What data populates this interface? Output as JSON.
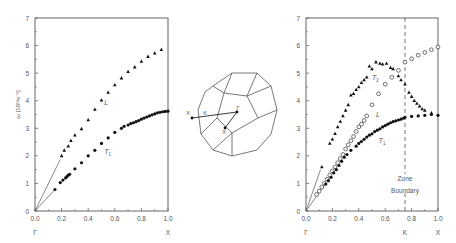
{
  "figure": {
    "colors": {
      "axis": "#666666",
      "marker": "#111111",
      "line": "#555555",
      "text": "#555555"
    }
  },
  "chart_data": [
    {
      "type": "scatter",
      "title": "",
      "xlabel": "",
      "ylabel": "ω [10¹³s⁻¹]",
      "xlim": [
        0,
        1.0
      ],
      "ylim": [
        0,
        7
      ],
      "xticks": [
        "0.0",
        "0.2",
        "0.4",
        "0.6",
        "0.8",
        "1.0"
      ],
      "yticks": [
        "0",
        "1",
        "2",
        "3",
        "4",
        "5",
        "6",
        "7"
      ],
      "point_labels": [
        {
          "text": "Γ",
          "x": 0.0
        },
        {
          "text": "X",
          "x": 1.0
        }
      ],
      "grid": false,
      "series": [
        {
          "name": "L",
          "marker": "triangle",
          "x": [
            0.2,
            0.22,
            0.25,
            0.27,
            0.3,
            0.35,
            0.4,
            0.45,
            0.5,
            0.55,
            0.6,
            0.65,
            0.7,
            0.75,
            0.8,
            0.85,
            0.9,
            0.95
          ],
          "y": [
            2.0,
            2.2,
            2.35,
            2.55,
            2.75,
            2.98,
            3.3,
            3.68,
            4.02,
            4.3,
            4.57,
            4.82,
            5.05,
            5.22,
            5.42,
            5.6,
            5.72,
            5.85
          ]
        },
        {
          "name": "T₁",
          "marker": "circle",
          "x": [
            0.15,
            0.19,
            0.21,
            0.23,
            0.24,
            0.25,
            0.26,
            0.3,
            0.35,
            0.4,
            0.45,
            0.5,
            0.55,
            0.6,
            0.65,
            0.67,
            0.7,
            0.72,
            0.74,
            0.76,
            0.78,
            0.8,
            0.82,
            0.84,
            0.86,
            0.88,
            0.9,
            0.92,
            0.94,
            0.96,
            0.98,
            1.0
          ],
          "y": [
            0.78,
            1.03,
            1.12,
            1.2,
            1.25,
            1.3,
            1.33,
            1.53,
            1.75,
            2.0,
            2.2,
            2.45,
            2.65,
            2.85,
            3.0,
            3.07,
            3.12,
            3.17,
            3.2,
            3.24,
            3.28,
            3.33,
            3.37,
            3.41,
            3.45,
            3.49,
            3.52,
            3.56,
            3.58,
            3.6,
            3.61,
            3.62
          ]
        }
      ],
      "sound_lines": [
        {
          "x0": 0,
          "y0": 0,
          "x1": 0.19,
          "y1": 1.87
        },
        {
          "x0": 0,
          "y0": 0,
          "x1": 0.15,
          "y1": 0.78
        }
      ],
      "annotations": [
        {
          "text": "L",
          "x": 0.52,
          "y": 3.85,
          "italic": true
        },
        {
          "text": "T",
          "sub": "1",
          "x": 0.52,
          "y": 2.05,
          "italic": true
        }
      ]
    },
    {
      "type": "scatter",
      "title": "",
      "xlabel": "",
      "ylabel": "",
      "xlim": [
        0,
        1.0
      ],
      "ylim": [
        0,
        7
      ],
      "xticks": [
        "0.0",
        "0.2",
        "0.4",
        "0.6",
        "0.8",
        "1.0"
      ],
      "yticks": [
        "0",
        "1",
        "2",
        "3",
        "4",
        "5",
        "6",
        "7"
      ],
      "point_labels": [
        {
          "text": "Γ",
          "x": 0.0
        },
        {
          "text": "K",
          "x": 0.75
        },
        {
          "text": "X",
          "x": 1.0
        }
      ],
      "grid": false,
      "zone_boundary": {
        "x": 0.75,
        "label_line1": "Zone",
        "label_line2": "Boundary"
      },
      "series": [
        {
          "name": "T₂",
          "marker": "triangle",
          "x": [
            0.12,
            0.18,
            0.2,
            0.22,
            0.24,
            0.26,
            0.28,
            0.3,
            0.32,
            0.34,
            0.36,
            0.38,
            0.4,
            0.42,
            0.44,
            0.46,
            0.48,
            0.5,
            0.53,
            0.56,
            0.58,
            0.61,
            0.64,
            0.66,
            0.7,
            0.72,
            0.75,
            0.78,
            0.8,
            0.82,
            0.84,
            0.86,
            0.88,
            0.9,
            0.95
          ],
          "y": [
            1.6,
            2.45,
            2.6,
            2.8,
            3.05,
            3.25,
            3.45,
            3.65,
            3.85,
            4.2,
            4.25,
            4.4,
            4.5,
            4.65,
            4.75,
            4.85,
            5.25,
            5.15,
            5.4,
            5.35,
            5.32,
            5.35,
            5.2,
            5.15,
            4.9,
            4.75,
            4.6,
            4.3,
            4.15,
            4.0,
            3.9,
            3.8,
            3.7,
            3.65,
            3.55
          ]
        },
        {
          "name": "L",
          "marker": "open-circle",
          "x": [
            0.08,
            0.1,
            0.12,
            0.14,
            0.16,
            0.18,
            0.2,
            0.22,
            0.24,
            0.26,
            0.28,
            0.3,
            0.32,
            0.34,
            0.36,
            0.38,
            0.4,
            0.42,
            0.44,
            0.46,
            0.5,
            0.55,
            0.6,
            0.65,
            0.7,
            0.75,
            0.8,
            0.85,
            0.9,
            0.95,
            1.0
          ],
          "y": [
            0.6,
            0.72,
            0.87,
            1.0,
            1.15,
            1.3,
            1.45,
            1.6,
            1.75,
            1.9,
            2.05,
            2.25,
            2.4,
            2.55,
            2.7,
            2.88,
            3.05,
            3.15,
            3.28,
            3.45,
            3.85,
            4.25,
            4.6,
            4.85,
            5.1,
            5.4,
            5.52,
            5.65,
            5.75,
            5.85,
            5.95
          ]
        },
        {
          "name": "T₁",
          "marker": "circle",
          "x": [
            0.15,
            0.17,
            0.19,
            0.21,
            0.23,
            0.25,
            0.27,
            0.29,
            0.31,
            0.34,
            0.38,
            0.4,
            0.42,
            0.44,
            0.46,
            0.48,
            0.5,
            0.52,
            0.54,
            0.56,
            0.58,
            0.6,
            0.62,
            0.64,
            0.66,
            0.68,
            0.7,
            0.72,
            0.74,
            0.75,
            0.8,
            0.85,
            0.9,
            0.95,
            1.0
          ],
          "y": [
            0.98,
            1.1,
            1.22,
            1.38,
            1.5,
            1.65,
            1.8,
            1.95,
            2.05,
            2.2,
            2.35,
            2.45,
            2.52,
            2.6,
            2.68,
            2.75,
            2.8,
            2.88,
            2.93,
            2.98,
            3.05,
            3.1,
            3.15,
            3.2,
            3.24,
            3.27,
            3.3,
            3.33,
            3.37,
            3.4,
            3.43,
            3.45,
            3.47,
            3.5,
            3.47
          ]
        }
      ],
      "sound_lines": [
        {
          "x0": 0,
          "y0": 0,
          "x1": 0.11,
          "y1": 1.5
        },
        {
          "x0": 0,
          "y0": 0,
          "x1": 0.15,
          "y1": 1.0
        }
      ],
      "annotations": [
        {
          "text": "T",
          "sub": "2",
          "x": 0.5,
          "y": 4.75,
          "italic": true
        },
        {
          "text": "L",
          "x": 0.53,
          "y": 3.4,
          "italic": true
        },
        {
          "text": "T",
          "sub": "1",
          "x": 0.55,
          "y": 2.45,
          "italic": true
        }
      ]
    }
  ],
  "brillouin_zone": {
    "label": "fcc Brillouin zone",
    "points": [
      {
        "label": "X",
        "x": 192,
        "y": 118
      },
      {
        "label": "K",
        "x": 204,
        "y": 118
      },
      {
        "label": "Γ",
        "x": 237,
        "y": 113
      },
      {
        "label": "X",
        "x": 225,
        "y": 126
      }
    ]
  }
}
